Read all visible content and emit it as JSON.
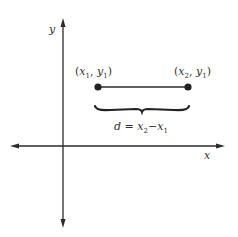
{
  "diagram": {
    "colors": {
      "ink": "#2b2b2b",
      "background": "#ffffff"
    },
    "axes": {
      "x_label": "x",
      "y_label": "y"
    },
    "points": [
      {
        "label_var": "x",
        "label_sub": "1",
        "label_var2": "y",
        "label_sub2": "1"
      },
      {
        "label_var": "x",
        "label_sub": "2",
        "label_var2": "y",
        "label_sub2": "1"
      }
    ],
    "formula": {
      "lhs": "d",
      "eq": " = ",
      "t1": "x",
      "t1_sub": "2",
      "minus": "−",
      "t2": "x",
      "t2_sub": "1"
    },
    "punct": {
      "open": "(",
      "comma": ", ",
      "close": ")"
    }
  }
}
